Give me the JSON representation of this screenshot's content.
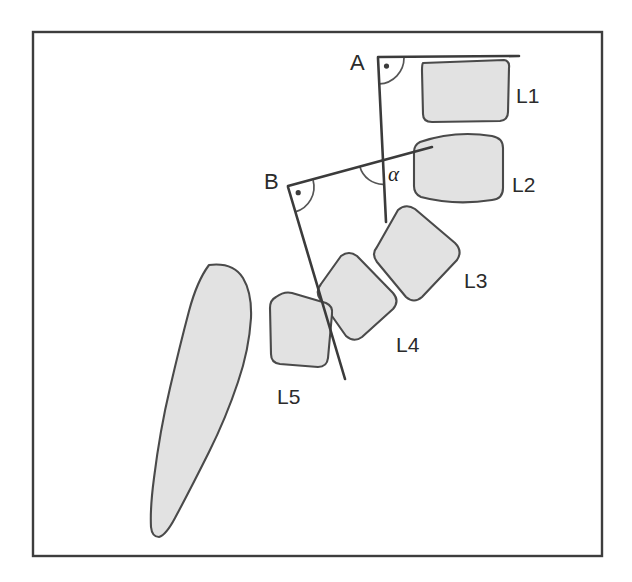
{
  "figure": {
    "background_color": "#ffffff",
    "frame": {
      "x": 33,
      "y": 32,
      "width": 569,
      "height": 524,
      "stroke_color": "#3d3d3d"
    },
    "palette": {
      "bone_fill": "#e2e2e2",
      "bone_outline": "#4a4a4a",
      "line_color": "#3b3b3b",
      "arc_color": "#555555",
      "text_color": "#2b2b2b"
    }
  },
  "point_labels": [
    {
      "id": "A",
      "text": "A",
      "x": 350,
      "y": 70
    },
    {
      "id": "B",
      "text": "B",
      "x": 264,
      "y": 189
    }
  ],
  "angle_labels": [
    {
      "id": "alpha",
      "text": "α",
      "x": 388,
      "y": 181
    }
  ],
  "vertebra_labels": [
    {
      "id": "L1",
      "text": "L1",
      "x": 516,
      "y": 103
    },
    {
      "id": "L2",
      "text": "L2",
      "x": 512,
      "y": 192
    },
    {
      "id": "L3",
      "text": "L3",
      "x": 464,
      "y": 288
    },
    {
      "id": "L4",
      "text": "L4",
      "x": 396,
      "y": 352
    },
    {
      "id": "L5",
      "text": "L5",
      "x": 277,
      "y": 404
    }
  ],
  "reference_lines": [
    {
      "id": "line-A-horizontal",
      "name": "superior-endplate-line-L1",
      "x1": 378,
      "y1": 57,
      "x2": 519,
      "y2": 56
    },
    {
      "id": "line-A-vertical",
      "name": "perpendicular-line-from-A",
      "x1": 378,
      "y1": 58,
      "x2": 386,
      "y2": 222
    },
    {
      "id": "line-B-oblique",
      "name": "superior-endplate-line-L5",
      "x1": 288,
      "y1": 186,
      "x2": 432,
      "y2": 147
    },
    {
      "id": "line-B-perpendicular",
      "name": "perpendicular-line-from-B",
      "x1": 288,
      "y1": 187,
      "x2": 345,
      "y2": 379
    }
  ],
  "right_angle_markers": [
    {
      "id": "right-angle-A",
      "cx": 378,
      "cy": 58,
      "radius": 26
    },
    {
      "id": "right-angle-B",
      "cx": 288,
      "cy": 187,
      "radius": 26
    }
  ],
  "vertebrae": [
    {
      "id": "L1",
      "path": "M 423,63 L 504,60 Q 510,61 509,68 L 508,112 Q 508,120 500,121 L 432,122 Q 423,122 423,114 L 422,71 Q 422,64 423,63 Z"
    },
    {
      "id": "L2",
      "path": "M 420,142 Q 455,130 492,136 Q 503,138 503,148 L 503,188 Q 503,199 492,200 Q 455,206 421,197 Q 414,194 414,186 L 414,152 Q 414,145 420,142 Z"
    },
    {
      "id": "L3",
      "path": "M 398,210 Q 406,203 415,209 L 455,243 Q 463,251 457,260 L 422,297 Q 414,304 406,297 L 377,262 Q 371,254 377,247 Z"
    },
    {
      "id": "L4",
      "path": "M 341,256 Q 349,250 357,256 L 393,293 Q 400,301 393,309 L 362,337 Q 354,343 346,336 L 320,299 Q 315,291 321,284 Z"
    },
    {
      "id": "L5",
      "path": "M 276,297 Q 284,291 292,293 L 326,303 Q 333,306 332,314 L 328,358 Q 327,367 318,367 L 280,364 Q 271,363 271,354 L 270,308 Q 270,300 276,297 Z"
    }
  ],
  "sacrum": {
    "id": "sacrum",
    "name": "sacrum-coccyx",
    "path": "M 209,265 Q 233,262 243,278 Q 252,293 251,318 Q 249,350 238,382 Q 226,418 209,452 Q 190,490 175,518 Q 166,535 159,537 Q 152,537 151,527 Q 150,508 154,478 Q 160,430 170,388 Q 180,345 189,311 Q 197,281 209,265 Z"
  }
}
